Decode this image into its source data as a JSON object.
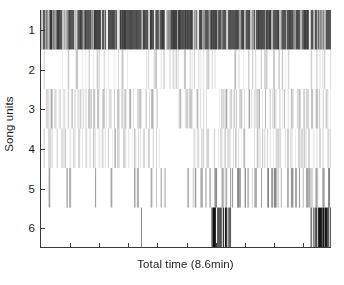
{
  "chart_data": {
    "type": "raster",
    "title": "",
    "xlabel": "Total time (8.6min)",
    "ylabel": "Song units",
    "ytick_labels": [
      "1",
      "2",
      "3",
      "4",
      "5",
      "6"
    ],
    "ytick_values": [
      1,
      2,
      3,
      4,
      5,
      6
    ],
    "ylim": [
      0.5,
      6.5
    ],
    "xlim": [
      0,
      8.6
    ],
    "x_units": "minutes",
    "x_tick_count": 10,
    "xtick_labels": [],
    "grid": false,
    "legend": null,
    "y_axis_inverted": true,
    "total_time_minutes": 8.6,
    "series": [
      {
        "name": "1",
        "unit": 1,
        "row_shade": "#5a5a5a",
        "density": "very-high",
        "band_fill": true,
        "seed": 1101,
        "event_count": 210,
        "description": "Dense dark band spanning the entire recording; near-continuous vocalization.",
        "gaps": []
      },
      {
        "name": "2",
        "unit": 2,
        "row_shade": "#d8d8d8",
        "density": "low",
        "band_fill": false,
        "seed": 2202,
        "event_count": 95,
        "description": "Sparse very light lines spread across the full duration.",
        "gaps": [
          [
            0.02,
            0.07
          ],
          [
            0.3,
            0.35
          ],
          [
            0.62,
            0.66
          ],
          [
            0.86,
            0.93
          ]
        ]
      },
      {
        "name": "3",
        "unit": 3,
        "row_shade": "#c6c6c6",
        "density": "medium",
        "band_fill": false,
        "seed": 3303,
        "event_count": 150,
        "description": "Moderate light-gray lines, interrupted by a gap just past the midpoint.",
        "gaps": [
          [
            0.4,
            0.47
          ],
          [
            0.57,
            0.61
          ]
        ]
      },
      {
        "name": "4",
        "unit": 4,
        "row_shade": "#d2d2d2",
        "density": "medium-low",
        "band_fill": false,
        "seed": 4404,
        "event_count": 130,
        "description": "Light lines with a pronounced silent gap around the centre of the session.",
        "gaps": [
          [
            0.41,
            0.52
          ],
          [
            0.7,
            0.73
          ]
        ]
      },
      {
        "name": "5",
        "unit": 5,
        "row_shade": "#a8a8a8",
        "density": "medium",
        "band_fill": false,
        "seed": 5505,
        "event_count": 105,
        "description": "Distinct mid-gray lines; sparse in the first half and markedly denser in the second half.",
        "gaps": [
          [
            0.1,
            0.17
          ],
          [
            0.26,
            0.31
          ],
          [
            0.44,
            0.5
          ]
        ]
      },
      {
        "name": "6",
        "unit": 6,
        "row_shade": "#202020",
        "density": "very-low",
        "band_fill": false,
        "seed": 6606,
        "event_count": 26,
        "description": "Mostly silent except two dense near-black bursts plus one isolated line.",
        "bursts": [
          {
            "start": 0.585,
            "end": 0.648,
            "lines": 11
          },
          {
            "start": 0.928,
            "end": 0.998,
            "lines": 12
          }
        ],
        "isolated_lines": [
          0.345
        ],
        "gaps": []
      }
    ]
  },
  "axis": {
    "ylabel_text": "Song units",
    "xlabel_text": "Total time (8.6min)",
    "tick_color": "#3a3a3a",
    "axis_color": "#3a3a3a",
    "background": "#ffffff",
    "text_color": "#1a1a1a"
  }
}
